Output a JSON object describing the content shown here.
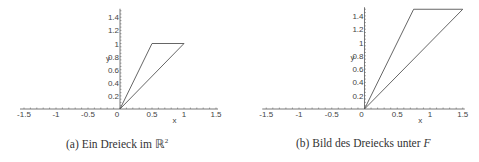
{
  "chart_data": [
    {
      "type": "line",
      "panel": "a",
      "caption_prefix": "(a) Ein Dreieck im ",
      "caption_symbol": "ℝ",
      "caption_sup": "2",
      "xlabel": "x",
      "ylabel": "y",
      "xlim": [
        -1.5,
        1.5
      ],
      "ylim": [
        0,
        1.5
      ],
      "xticks": [
        "-1.5",
        "-1",
        "-0.5",
        "0",
        "0.5",
        "1",
        "1.5"
      ],
      "yticks": [
        "0.2",
        "0.4",
        "0.6",
        "0.8",
        "1",
        "1.2",
        "1.4"
      ],
      "grid": false,
      "series": [
        {
          "name": "triangle",
          "points": [
            [
              0,
              0
            ],
            [
              0.5,
              1
            ],
            [
              1,
              1
            ],
            [
              0,
              0
            ]
          ]
        }
      ]
    },
    {
      "type": "line",
      "panel": "b",
      "caption_prefix": "(b) Bild des Dreiecks unter ",
      "caption_symbol": "F",
      "xlabel": "x",
      "ylabel": "y",
      "xlim": [
        -1.5,
        1.5
      ],
      "ylim": [
        0,
        1.5
      ],
      "xticks": [
        "-1.5",
        "-1",
        "-0.5",
        "0",
        "0.5",
        "1",
        "1.5"
      ],
      "yticks": [
        "0.2",
        "0.4",
        "0.6",
        "0.8",
        "1",
        "1.2",
        "1.4"
      ],
      "grid": false,
      "series": [
        {
          "name": "image-triangle",
          "points": [
            [
              0,
              0
            ],
            [
              0.75,
              1.5
            ],
            [
              1.5,
              1.5
            ],
            [
              0,
              0
            ]
          ]
        }
      ]
    }
  ],
  "captions": {
    "a": {
      "prefix": "(a) Ein Dreieck im ",
      "symbol": "ℝ",
      "sup": "2"
    },
    "b": {
      "prefix": "(b) Bild des Dreiecks unter ",
      "symbol": "F"
    }
  },
  "colors": {
    "line": "#555555",
    "axis": "#555555",
    "text": "#444444"
  }
}
